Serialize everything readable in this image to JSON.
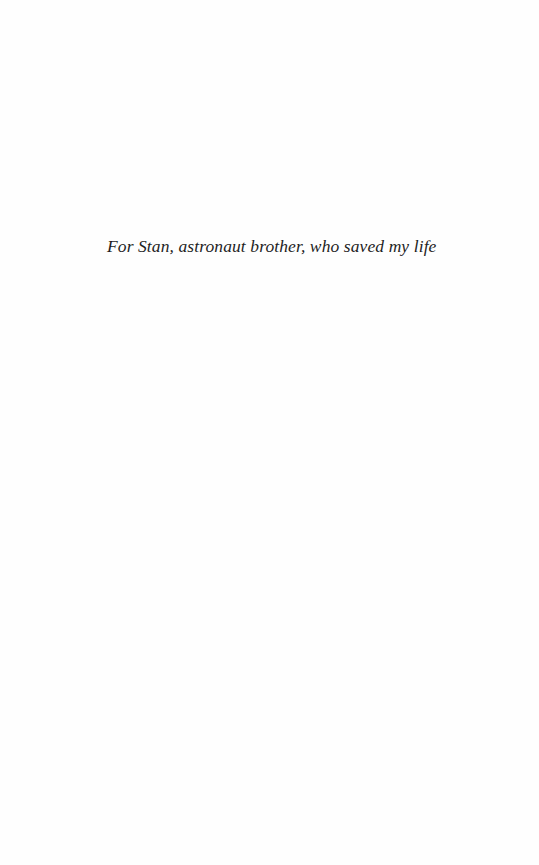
{
  "page": {
    "type": "dedication",
    "dedication_text": "For Stan, astronaut brother, who saved my life",
    "colors": {
      "background": "#fefefe",
      "text": "#1e1e1e"
    }
  }
}
